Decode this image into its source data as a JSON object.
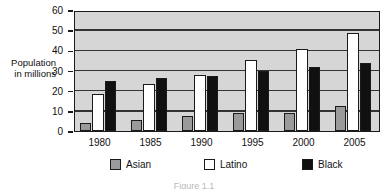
{
  "chart_data": {
    "type": "bar",
    "title": "",
    "xlabel": "",
    "ylabel": "Population\nin millions",
    "ylabel_line1": "Population",
    "ylabel_line2": "in millions",
    "ylim": [
      0,
      60
    ],
    "ytick_values": [
      0,
      10,
      20,
      30,
      40,
      50,
      60
    ],
    "ytick_labels": [
      "0",
      "10",
      "20",
      "30",
      "40",
      "50",
      "60"
    ],
    "grid": true,
    "grid_axis": "y",
    "legend_position": "bottom",
    "categories": [
      "1980",
      "1985",
      "1990",
      "1995",
      "2000",
      "2005"
    ],
    "series": [
      {
        "name": "Asian",
        "color": "#9a9a9a",
        "values": [
          4,
          5.5,
          7.5,
          9,
          9,
          12.5
        ]
      },
      {
        "name": "Latino",
        "color": "#ffffff",
        "values": [
          18.5,
          23.5,
          28,
          35,
          40.5,
          48.5
        ]
      },
      {
        "name": "Black",
        "color": "#101010",
        "values": [
          25,
          26.5,
          27.5,
          30,
          31.5,
          33.5
        ]
      }
    ]
  },
  "legend": {
    "items": [
      {
        "label": "Asian",
        "swatch": "asian"
      },
      {
        "label": "Latino",
        "swatch": "latino"
      },
      {
        "label": "Black",
        "swatch": "black"
      }
    ]
  },
  "caption": {
    "text": "Figure 1.1"
  },
  "colors": {
    "plot_background": "#d6d6d6",
    "axis": "#1a1a1a",
    "gridline": "#333333",
    "asian": "#9a9a9a",
    "latino": "#ffffff",
    "black": "#101010"
  }
}
